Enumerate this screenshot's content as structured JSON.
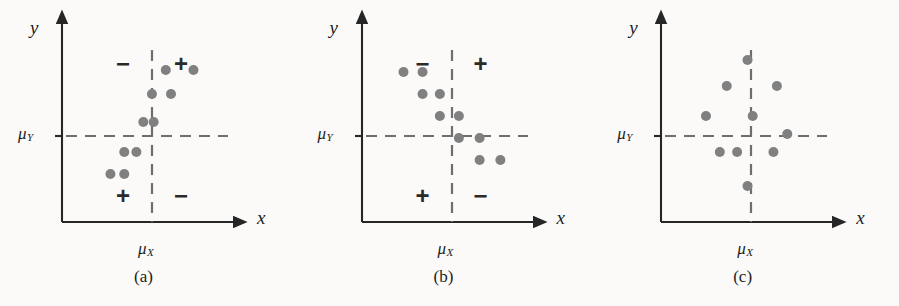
{
  "figure": {
    "background_color": "#fbfaf8",
    "axis_color": "#262626",
    "dash_color": "#6e6e6e",
    "dot_color": "#808080",
    "panels": [
      {
        "id": "a",
        "caption": "(a)",
        "y_axis_label": "y",
        "x_axis_label": "x",
        "mu_y_label": "μ",
        "mu_y_sub": "Y",
        "mu_x_label": "μ",
        "mu_x_sub": "X",
        "quadrant_signs": {
          "top_left": "−",
          "top_right": "+",
          "bottom_left": "+",
          "bottom_right": "−"
        },
        "relationship": "positive correlation",
        "points": [
          {
            "x": 60,
            "y": 76
          },
          {
            "x": 76,
            "y": 76
          },
          {
            "x": 52,
            "y": 64
          },
          {
            "x": 63,
            "y": 64
          },
          {
            "x": 47,
            "y": 50
          },
          {
            "x": 53,
            "y": 50
          },
          {
            "x": 36,
            "y": 35
          },
          {
            "x": 43,
            "y": 35
          },
          {
            "x": 28,
            "y": 24
          },
          {
            "x": 36,
            "y": 24
          }
        ]
      },
      {
        "id": "b",
        "caption": "(b)",
        "y_axis_label": "y",
        "x_axis_label": "x",
        "mu_y_label": "μ",
        "mu_y_sub": "Y",
        "mu_x_label": "μ",
        "mu_x_sub": "X",
        "quadrant_signs": {
          "top_left": "−",
          "top_right": "+",
          "bottom_left": "+",
          "bottom_right": "−"
        },
        "relationship": "negative correlation",
        "points": [
          {
            "x": 24,
            "y": 75
          },
          {
            "x": 35,
            "y": 75
          },
          {
            "x": 35,
            "y": 64
          },
          {
            "x": 45,
            "y": 64
          },
          {
            "x": 45,
            "y": 53
          },
          {
            "x": 56,
            "y": 53
          },
          {
            "x": 56,
            "y": 42
          },
          {
            "x": 68,
            "y": 42
          },
          {
            "x": 68,
            "y": 31
          },
          {
            "x": 80,
            "y": 31
          }
        ]
      },
      {
        "id": "c",
        "caption": "(c)",
        "y_axis_label": "y",
        "x_axis_label": "x",
        "mu_y_label": "μ",
        "mu_y_sub": "Y",
        "mu_x_label": "μ",
        "mu_x_sub": "X",
        "quadrant_signs": null,
        "relationship": "no correlation",
        "points": [
          {
            "x": 50,
            "y": 81
          },
          {
            "x": 38,
            "y": 68
          },
          {
            "x": 67,
            "y": 68
          },
          {
            "x": 26,
            "y": 53
          },
          {
            "x": 53,
            "y": 53
          },
          {
            "x": 73,
            "y": 44
          },
          {
            "x": 34,
            "y": 35
          },
          {
            "x": 44,
            "y": 35
          },
          {
            "x": 65,
            "y": 35
          },
          {
            "x": 50,
            "y": 18
          }
        ]
      }
    ]
  }
}
